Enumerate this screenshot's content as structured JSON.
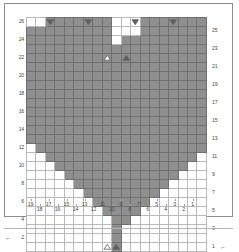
{
  "chart_title": "Heart Motif Knitting Chart",
  "chart_data": {
    "type": "heatmap",
    "xlabel": "",
    "ylabel": "",
    "grid": true,
    "columns": 19,
    "rows": 26,
    "column_order": "right-to-left",
    "row_order": "bottom-to-top",
    "column_tick_labels": [
      "19",
      "18",
      "17",
      "16",
      "15",
      "14",
      "13",
      "12",
      "11",
      "10",
      "9",
      "8",
      "7",
      "6",
      "5",
      "4",
      "3",
      "2",
      "1"
    ],
    "row_tick_labels_left": [
      "26",
      "24",
      "22",
      "20",
      "18",
      "16",
      "14",
      "12",
      "10",
      "8",
      "6",
      "4",
      "2"
    ],
    "row_tick_labels_right": [
      "25",
      "23",
      "21",
      "19",
      "17",
      "15",
      "13",
      "11",
      "9",
      "7",
      "5",
      "3",
      "1"
    ],
    "legend": [],
    "colors": {
      "filled_cell": "#8f8f8f",
      "empty_cell": "#ffffff",
      "grid_line": "#b9b9b9",
      "filled_grid_line": "#6f6f6f",
      "marker_dark": "#5f5f5f",
      "marker_light": "#ffffff",
      "frame": "#8d8d8d",
      "label_text": "#4a4a4a"
    },
    "annotations": {
      "row_arrow_left": "←",
      "row_arrow_right": "←",
      "arrow_rows": [
        "2",
        "1"
      ]
    },
    "cell_map": [
      "0001111111000111111100",
      "0111111111000111111110",
      "1111111111011111111111",
      "1111111111111111111111",
      "1111111111111111111111",
      "1111111111111111111111",
      "1111111111111111111111",
      "1111111111111111111111",
      "1111111111111111111111",
      "1111111111111111111111",
      "1111111111111111111111",
      "1111111111111111111111",
      "0111111111111111111110",
      "0111111111111111111110",
      "0011111111111111111100",
      "0001111111111111111000",
      "0000111111111111110000",
      "0000011111111111100000",
      "0000001111111111000000",
      "0000000111111110000000",
      "0000000011111100000000",
      "0000000001111000000000",
      "0000000000110000000000"
    ],
    "markers": [
      {
        "name": "decrease-down",
        "glyph": "triangle-down",
        "fill": "dark",
        "row": 26,
        "column": 17
      },
      {
        "name": "decrease-down",
        "glyph": "triangle-down",
        "fill": "dark",
        "row": 26,
        "column": 13
      },
      {
        "name": "decrease-down",
        "glyph": "triangle-down",
        "fill": "dark",
        "row": 26,
        "column": 8
      },
      {
        "name": "decrease-down",
        "glyph": "triangle-down",
        "fill": "dark",
        "row": 26,
        "column": 4
      },
      {
        "name": "increase-up",
        "glyph": "triangle-up",
        "fill": "light",
        "row": 22,
        "column": 11
      },
      {
        "name": "increase-up",
        "glyph": "triangle-up",
        "fill": "dark",
        "row": 22,
        "column": 9
      },
      {
        "name": "increase-up",
        "glyph": "triangle-up",
        "fill": "light",
        "row": 1,
        "column": 11
      },
      {
        "name": "increase-up",
        "glyph": "triangle-up",
        "fill": "dark",
        "row": 1,
        "column": 10
      }
    ]
  }
}
